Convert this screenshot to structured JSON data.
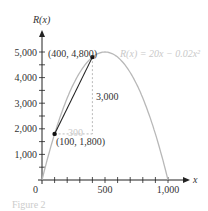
{
  "chart_data": {
    "type": "line",
    "title": "",
    "xlabel": "x",
    "ylabel": "R(x)",
    "equation_label": "R(x) = 20x − 0.02x²",
    "function": {
      "a": -0.02,
      "b": 20,
      "c": 0
    },
    "xlim": [
      0,
      1000
    ],
    "ylim": [
      0,
      5000
    ],
    "x_ticks": [
      "0",
      "500",
      "1,000"
    ],
    "y_ticks": [
      "1,000",
      "2,000",
      "3,000",
      "4,000",
      "5,000"
    ],
    "points": [
      {
        "x": 100,
        "y": 1800,
        "label": "(100, 1,800)"
      },
      {
        "x": 400,
        "y": 4800,
        "label": "(400, 4,800)"
      }
    ],
    "secant": {
      "run_label": "300",
      "rise_label": "3,000"
    },
    "grid": false,
    "caption": "Figure 2"
  }
}
